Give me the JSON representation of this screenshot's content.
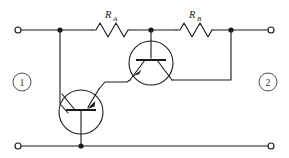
{
  "figure": {
    "kind": "circuit-schematic",
    "width": 289,
    "height": 158,
    "background_color": "#ffffff",
    "line_color": "#1a1a1a",
    "node_label_color": "#3a3a3a"
  },
  "components": {
    "resistors": [
      {
        "id": "R_A",
        "label_main": "R",
        "label_sub": "A",
        "label_x": 111,
        "label_y": 16,
        "body_x": 92,
        "body_y": 30,
        "body_width": 36
      },
      {
        "id": "R_B",
        "label_main": "R",
        "label_sub": "B",
        "label_x": 189,
        "label_y": 16,
        "body_x": 176,
        "body_y": 30,
        "body_width": 36
      }
    ],
    "transistors": [
      {
        "id": "Q-upper",
        "type": "bjt",
        "polarity": "pnp",
        "center_x": 151,
        "center_y": 63,
        "radius": 22,
        "arrow_on": "lower-left-lead",
        "arrow_direction": "inward-toward-base"
      },
      {
        "id": "Q-lower",
        "type": "bjt",
        "polarity": "pnp",
        "center_x": 81,
        "center_y": 112,
        "radius": 22,
        "arrow_on": "upper-right-lead",
        "arrow_direction": "inward-toward-base"
      }
    ],
    "terminals": [
      {
        "id": "top-left",
        "x": 18,
        "y": 30,
        "r": 3
      },
      {
        "id": "top-right",
        "x": 271,
        "y": 30,
        "r": 3
      },
      {
        "id": "bottom-left",
        "x": 18,
        "y": 146,
        "r": 3
      },
      {
        "id": "bottom-right",
        "x": 271,
        "y": 146,
        "r": 3
      }
    ],
    "junction_dots": [
      {
        "id": "top-left-node",
        "x": 60,
        "y": 30,
        "r": 2.6
      },
      {
        "id": "top-mid-node",
        "x": 151,
        "y": 30,
        "r": 2.6
      },
      {
        "id": "top-right-node",
        "x": 231,
        "y": 30,
        "r": 2.6
      },
      {
        "id": "bottom-mid-node",
        "x": 81,
        "y": 146,
        "r": 2.6
      }
    ]
  },
  "port_labels": [
    {
      "id": "port-1",
      "text": "1",
      "cx": 22,
      "cy": 82,
      "r": 9
    },
    {
      "id": "port-2",
      "text": "2",
      "cx": 268,
      "cy": 82,
      "r": 9
    }
  ]
}
